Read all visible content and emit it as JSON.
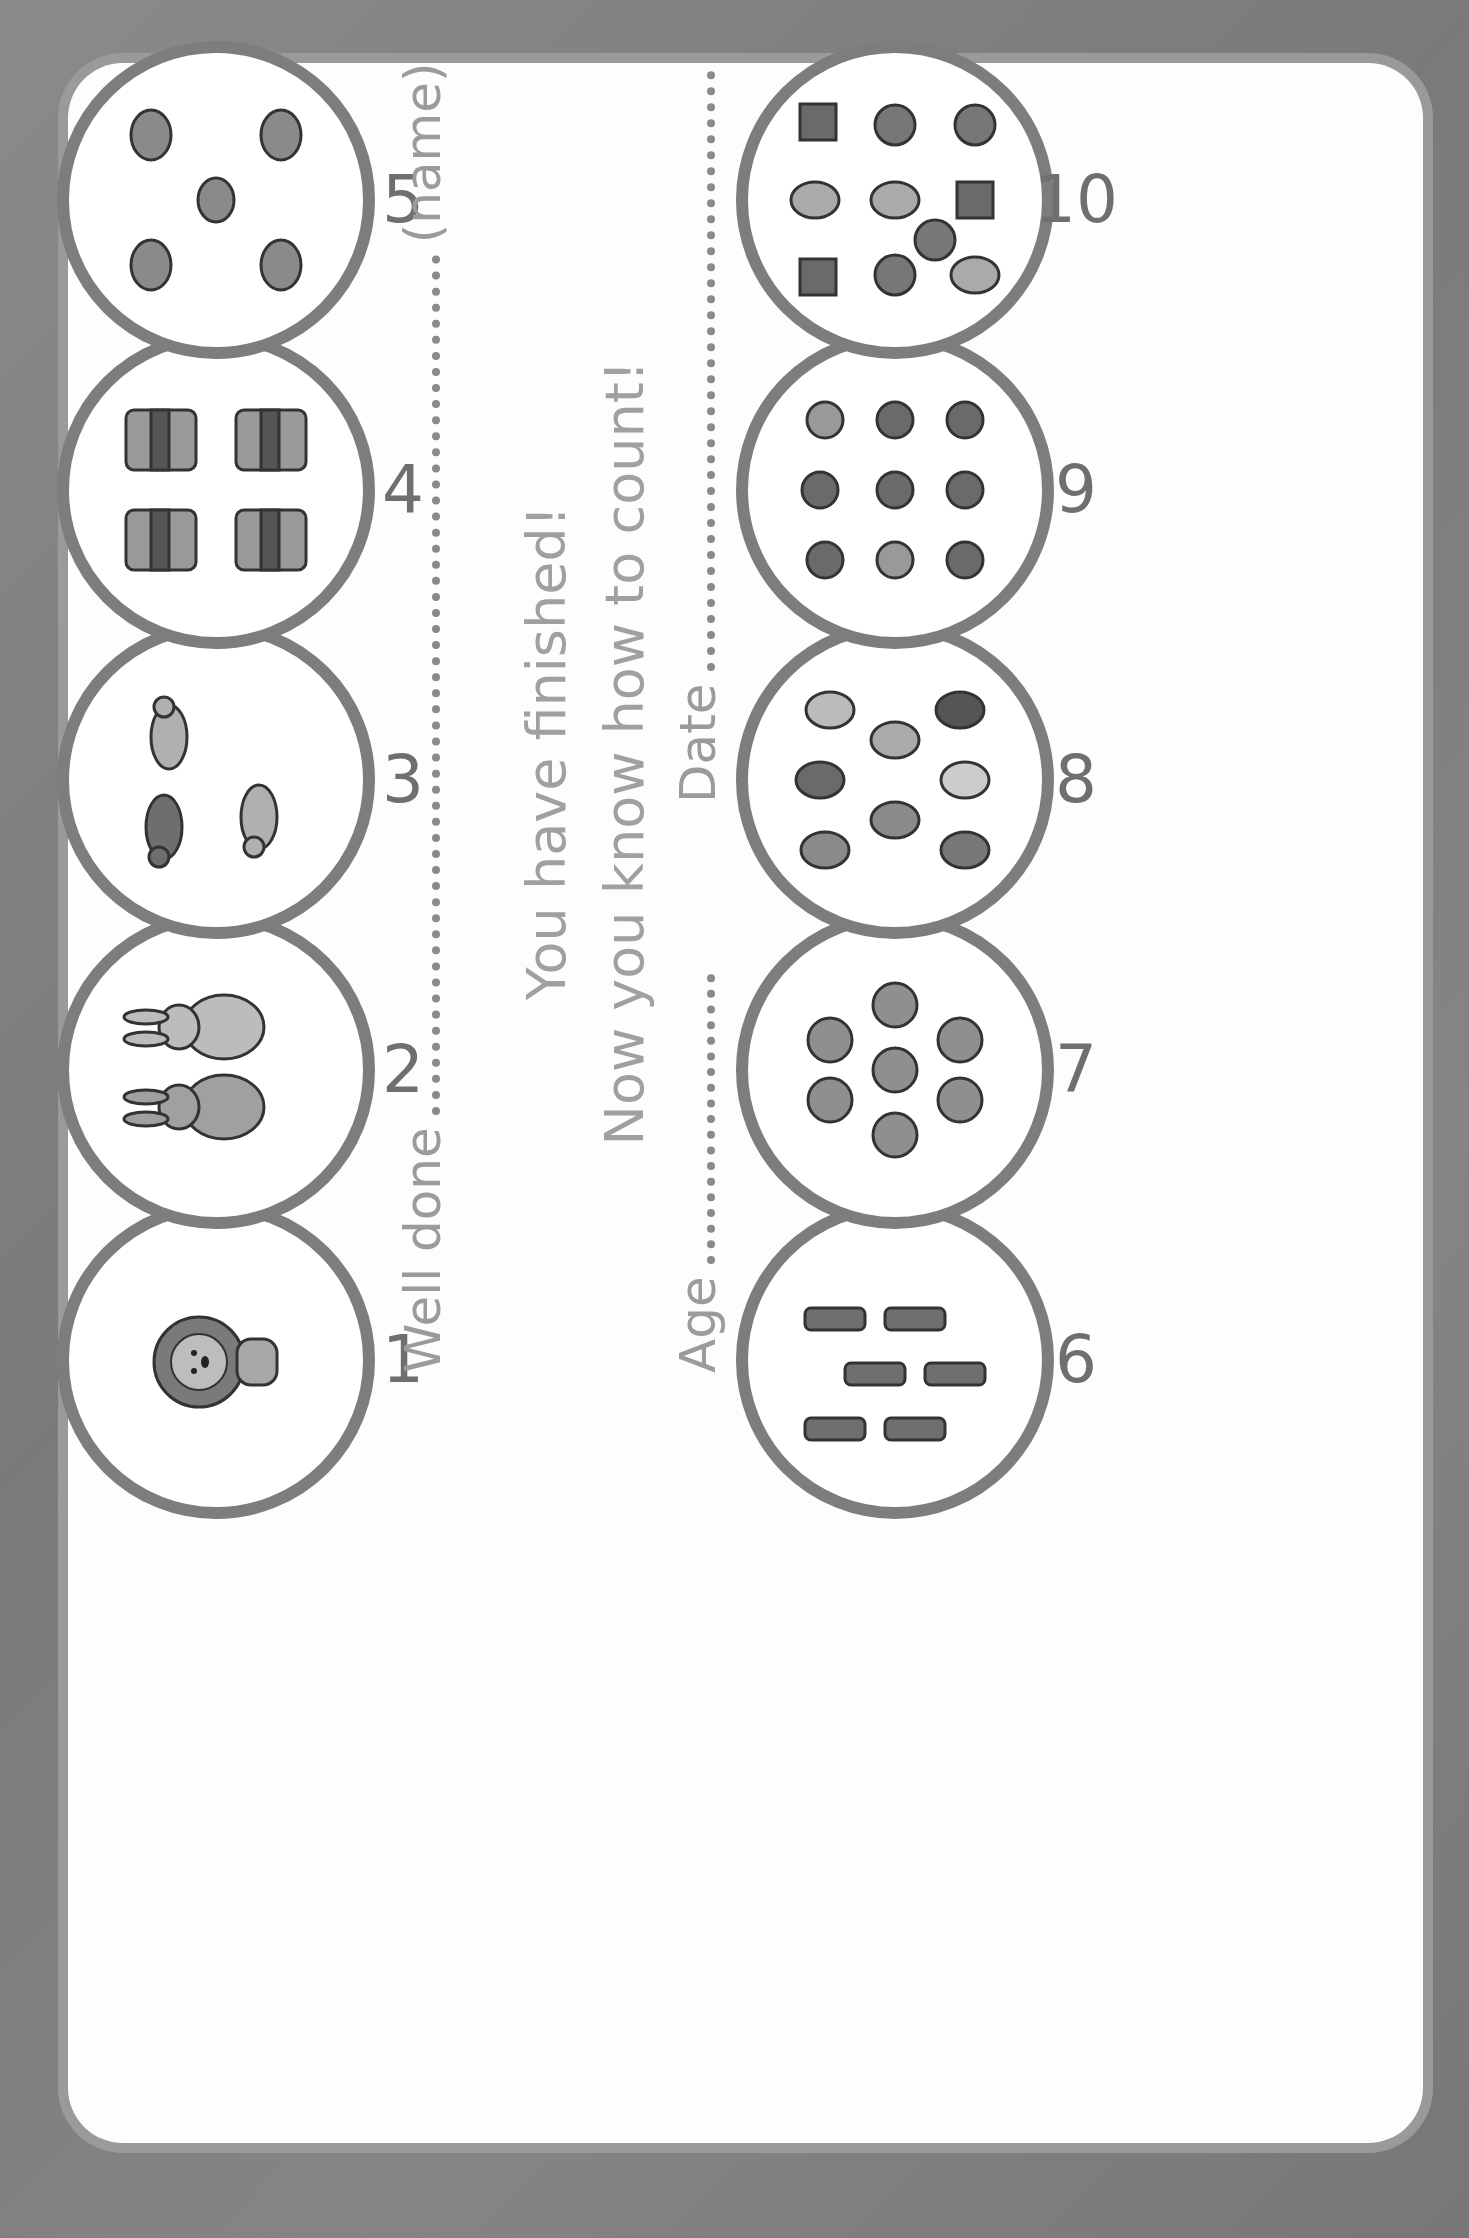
{
  "worksheet": {
    "top_row": [
      {
        "number": "1",
        "object": "lion",
        "count": 1
      },
      {
        "number": "2",
        "object": "rabbit",
        "count": 2
      },
      {
        "number": "3",
        "object": "mouse",
        "count": 3
      },
      {
        "number": "4",
        "object": "cake",
        "count": 4
      },
      {
        "number": "5",
        "object": "fish",
        "count": 5
      }
    ],
    "bottom_row": [
      {
        "number": "6",
        "object": "sock",
        "count": 6
      },
      {
        "number": "7",
        "object": "apple",
        "count": 7
      },
      {
        "number": "8",
        "object": "balloon",
        "count": 8
      },
      {
        "number": "9",
        "object": "bird",
        "count": 9
      },
      {
        "number": "10",
        "object": "sweet",
        "count": 10
      }
    ],
    "well_done_label": "Well done",
    "name_hint": "(name)",
    "message_line1": "You have finished!",
    "message_line2": "Now you know how to count!",
    "age_label": "Age",
    "date_label": "Date"
  },
  "colors": {
    "background": "#808080",
    "card": "#fdfdfd",
    "circle_border": "#7d7d7d",
    "text_light": "#9b9b9b",
    "number_text": "#6f6f6f"
  }
}
